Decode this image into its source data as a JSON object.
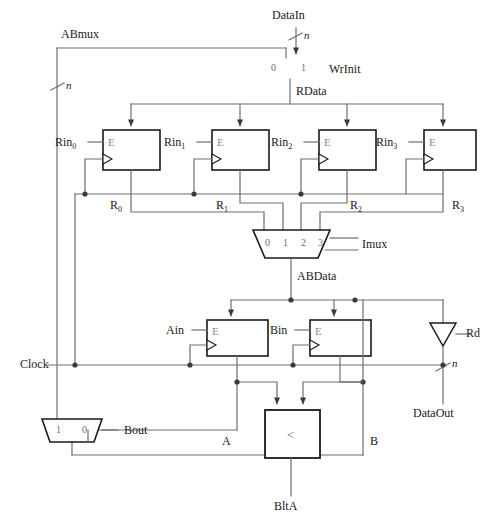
{
  "diagram": {
    "colors": {
      "wire": "#6e6e6e",
      "box_border": "#1a1a1a",
      "text": "#1a1a1a",
      "faint_text": "#8a8a8a",
      "background": "#ffffff"
    },
    "signals": {
      "abmux": "ABmux",
      "datain": "DataIn",
      "wrinit": "WrInit",
      "rdata": "RData",
      "imux": "Imux",
      "abdata": "ABData",
      "clock": "Clock",
      "rd": "Rd",
      "dataout": "DataOut",
      "bout": "Bout",
      "bita": "BltA",
      "a_bus": "A",
      "b_bus": "B",
      "width_mark": "n"
    },
    "registers": [
      {
        "enable": "Rin",
        "enable_sub": "0",
        "output": "R",
        "output_sub": "0",
        "enable_glyph": "E"
      },
      {
        "enable": "Rin",
        "enable_sub": "1",
        "output": "R",
        "output_sub": "1",
        "enable_glyph": "E"
      },
      {
        "enable": "Rin",
        "enable_sub": "2",
        "output": "R",
        "output_sub": "2",
        "enable_glyph": "E"
      },
      {
        "enable": "Rin",
        "enable_sub": "3",
        "output": "R",
        "output_sub": "3",
        "enable_glyph": "E"
      }
    ],
    "ab_registers": [
      {
        "enable": "Ain",
        "enable_glyph": "E"
      },
      {
        "enable": "Bin",
        "enable_glyph": "E"
      }
    ],
    "muxes": [
      {
        "name": "WrInit",
        "inputs": [
          "0",
          "1"
        ]
      },
      {
        "name": "Imux",
        "inputs": [
          "0",
          "1",
          "2",
          "3"
        ]
      },
      {
        "name": "Bout",
        "inputs": [
          "1",
          "0"
        ]
      }
    ],
    "comparator": {
      "symbol": "<",
      "output": "BltA"
    },
    "tristate": {
      "name": "Rd",
      "output": "DataOut"
    },
    "width_marks": [
      "n",
      "n",
      "n"
    ]
  }
}
